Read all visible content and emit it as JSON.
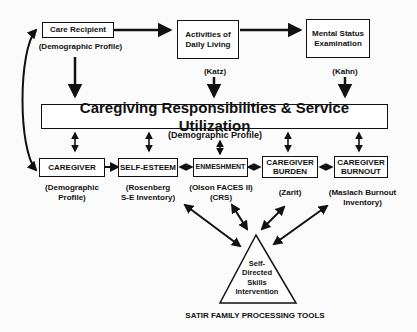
{
  "diagram": {
    "top_row": {
      "care_recipient": {
        "label": "Care Recipient",
        "sub": "(Demographic Profile)"
      },
      "adl": {
        "label_line1": "Activities of",
        "label_line2": "Daily Living",
        "sub": "(Katz)"
      },
      "mental_status": {
        "label_line1": "Mental Status",
        "label_line2": "Examination",
        "sub": "(Kahn)"
      }
    },
    "central": {
      "title": "Caregiving Responsibilities & Service Utilization",
      "sub": "(Demographic Profile)"
    },
    "middle_row": {
      "caregiver": {
        "label": "CAREGIVER",
        "sub_line1": "(Demographic",
        "sub_line2": "Profile)"
      },
      "self_esteem": {
        "label": "SELF-ESTEEM",
        "sub_line1": "(Rosenberg",
        "sub_line2": "S-E Inventory)"
      },
      "enmeshment": {
        "label": "ENMESHMENT",
        "sub_line1": "(Olson FACES II)",
        "sub_line2": "(CRS)"
      },
      "burden": {
        "label_line1": "CAREGIVER",
        "label_line2": "BURDEN",
        "sub": "(Zarit)"
      },
      "burnout": {
        "label_line1": "CAREGIVER",
        "label_line2": "BURNOUT",
        "sub_line1": "(Maslach Burnout",
        "sub_line2": "Inventory)"
      }
    },
    "intervention": {
      "line1": "Self-",
      "line2": "Directed",
      "line3": "Skills",
      "line4": "Intervention",
      "caption": "SATIR FAMILY PROCESSING TOOLS"
    },
    "colors": {
      "ink": "#111111",
      "background": "#fbfbfb"
    }
  }
}
